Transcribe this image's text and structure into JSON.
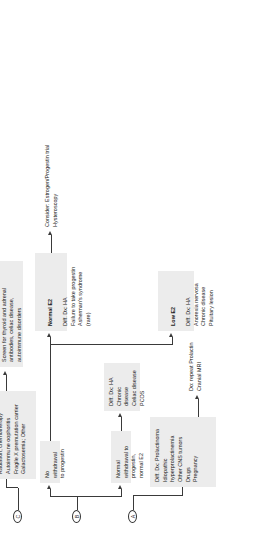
{
  "diagram": {
    "orientation": "rotated-90-ccw",
    "accent_box_color": "#ececec",
    "line_color": "#3a3a3a"
  },
  "nodes": {
    "a": "A",
    "b": "B",
    "c": "C"
  },
  "branch_a": {
    "diff_dx": "Diff. Dx: Prolactinoma\nIdiopathic hyperprolactinemia\nOther CNS tumors\nDrugs\nPregnancy",
    "action": "Do: repeat Prolactin\nCranial MRI"
  },
  "branch_b": {
    "normal_withdrawal": "Normal withdrawal to\nprogestin, normal E2",
    "normal_withdrawal_dx": "Diff. Dx: HA\nChronic disease\nCeliac disease\nPCOS",
    "no_withdrawal": "No withdrawal\nto progestin",
    "low_e2_title": "Low E2",
    "low_e2_body": "Diff. Dx: HA\nAnorexia nervosa\nChronic disease\nPituitary lesion",
    "normal_e2_title": "Normal E2",
    "normal_e2_body": "Diff. Dx: HA\nFailure to take progestin\nAsherman's syndrome (rare)",
    "normal_e2_action": "Consider: Estrogen/Progestin trial\nHysteroscopy"
  },
  "branch_c": {
    "diff_dx": "Diff. Dx: POI\nTurner Syndrome\nRadiation, chemotherapy\nAutoimmune oophoritis\nFragile X premutation carrier\nGalactosemia; Other",
    "action": "Do: Karyotype and Fragile X testing\nScreen for thyroid and adrenal\nantibodies, celiac disease,\nautoimmune disorders"
  }
}
